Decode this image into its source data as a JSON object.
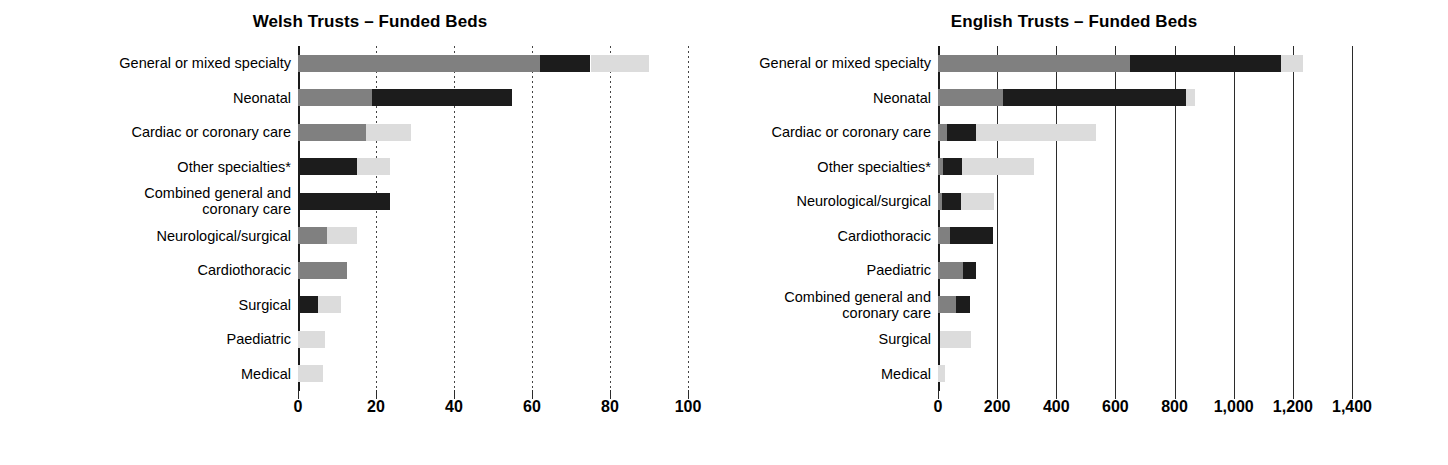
{
  "chart_data": [
    {
      "type": "bar",
      "orientation": "horizontal",
      "stacked": true,
      "title": "Welsh Trusts – Funded Beds",
      "xlabel": "",
      "ylabel": "",
      "xlim": [
        0,
        100
      ],
      "xticks": [
        0,
        20,
        40,
        60,
        80,
        100
      ],
      "xtick_labels": [
        "0",
        "20",
        "40",
        "60",
        "80",
        "100"
      ],
      "grid": "dotted-vertical",
      "legend": "none",
      "series": [
        {
          "name": "mid-grey",
          "color": "#808080"
        },
        {
          "name": "black",
          "color": "#1c1c1c"
        },
        {
          "name": "light-grey",
          "color": "#dcdcdc"
        }
      ],
      "categories": [
        "General or mixed specialty",
        "Neonatal",
        "Cardiac or coronary care",
        "Other specialties*",
        "Combined general and\ncoronary care",
        "Neurological/surgical",
        "Cardiothoracic",
        "Surgical",
        "Paediatric",
        "Medical"
      ],
      "values": [
        {
          "category": "General or mixed specialty",
          "segments": [
            62,
            13,
            15
          ],
          "total": 90
        },
        {
          "category": "Neonatal",
          "segments": [
            19,
            36,
            0
          ],
          "total": 55
        },
        {
          "category": "Cardiac or coronary care",
          "segments": [
            17.5,
            0,
            11.5
          ],
          "total": 29
        },
        {
          "category": "Other specialties*",
          "segments": [
            0,
            15,
            8.5
          ],
          "total": 23.5
        },
        {
          "category": "Combined general and coronary care",
          "segments": [
            0,
            23.5,
            0
          ],
          "total": 23.5
        },
        {
          "category": "Neurological/surgical",
          "segments": [
            7.5,
            0,
            7.5
          ],
          "total": 15
        },
        {
          "category": "Cardiothoracic",
          "segments": [
            12.5,
            0,
            0
          ],
          "total": 12.5
        },
        {
          "category": "Surgical",
          "segments": [
            0,
            5,
            6
          ],
          "total": 11
        },
        {
          "category": "Paediatric",
          "segments": [
            0,
            0,
            7
          ],
          "total": 7
        },
        {
          "category": "Medical",
          "segments": [
            0,
            0,
            6.5
          ],
          "total": 6.5
        }
      ]
    },
    {
      "type": "bar",
      "orientation": "horizontal",
      "stacked": true,
      "title": "English Trusts – Funded Beds",
      "xlabel": "",
      "ylabel": "",
      "xlim": [
        0,
        1400
      ],
      "xticks": [
        0,
        200,
        400,
        600,
        800,
        1000,
        1200,
        1400
      ],
      "xtick_labels": [
        "0",
        "200",
        "400",
        "600",
        "800",
        "1,000",
        "1,200",
        "1,400"
      ],
      "grid": "solid-vertical",
      "legend": "none",
      "series": [
        {
          "name": "mid-grey",
          "color": "#808080"
        },
        {
          "name": "black",
          "color": "#1c1c1c"
        },
        {
          "name": "light-grey",
          "color": "#dcdcdc"
        }
      ],
      "categories": [
        "General or mixed specialty",
        "Neonatal",
        "Cardiac or coronary care",
        "Other specialties*",
        "Neurological/surgical",
        "Cardiothoracic",
        "Paediatric",
        "Combined general and\ncoronary care",
        "Surgical",
        "Medical"
      ],
      "values": [
        {
          "category": "General or mixed specialty",
          "segments": [
            650,
            510,
            75
          ],
          "total": 1235
        },
        {
          "category": "Neonatal",
          "segments": [
            220,
            620,
            30
          ],
          "total": 870
        },
        {
          "category": "Cardiac or coronary care",
          "segments": [
            30,
            100,
            405
          ],
          "total": 535
        },
        {
          "category": "Other specialties*",
          "segments": [
            18,
            62,
            245
          ],
          "total": 325
        },
        {
          "category": "Neurological/surgical",
          "segments": [
            15,
            62,
            113
          ],
          "total": 190
        },
        {
          "category": "Cardiothoracic",
          "segments": [
            42,
            143,
            0
          ],
          "total": 185
        },
        {
          "category": "Paediatric",
          "segments": [
            85,
            45,
            0
          ],
          "total": 130
        },
        {
          "category": "Combined general and coronary care",
          "segments": [
            60,
            48,
            0
          ],
          "total": 108
        },
        {
          "category": "Surgical",
          "segments": [
            0,
            8,
            102
          ],
          "total": 110
        },
        {
          "category": "Medical",
          "segments": [
            0,
            0,
            25
          ],
          "total": 25
        }
      ]
    }
  ],
  "welsh": {
    "title": "Welsh Trusts – Funded Beds",
    "categories": [
      {
        "label": "General or mixed specialty"
      },
      {
        "label": "Neonatal"
      },
      {
        "label": "Cardiac or coronary care"
      },
      {
        "label": "Other specialties*"
      },
      {
        "label": "Combined general and\ncoronary care"
      },
      {
        "label": "Neurological/surgical"
      },
      {
        "label": "Cardiothoracic"
      },
      {
        "label": "Surgical"
      },
      {
        "label": "Paediatric"
      },
      {
        "label": "Medical"
      }
    ],
    "ticks": [
      {
        "label": "0"
      },
      {
        "label": "20"
      },
      {
        "label": "40"
      },
      {
        "label": "60"
      },
      {
        "label": "80"
      },
      {
        "label": "100"
      }
    ]
  },
  "english": {
    "title": "English Trusts – Funded Beds",
    "categories": [
      {
        "label": "General or mixed specialty"
      },
      {
        "label": "Neonatal"
      },
      {
        "label": "Cardiac or coronary care"
      },
      {
        "label": "Other specialties*"
      },
      {
        "label": "Neurological/surgical"
      },
      {
        "label": "Cardiothoracic"
      },
      {
        "label": "Paediatric"
      },
      {
        "label": "Combined general and\ncoronary care"
      },
      {
        "label": "Surgical"
      },
      {
        "label": "Medical"
      }
    ],
    "ticks": [
      {
        "label": "0"
      },
      {
        "label": "200"
      },
      {
        "label": "400"
      },
      {
        "label": "600"
      },
      {
        "label": "800"
      },
      {
        "label": "1,000"
      },
      {
        "label": "1,200"
      },
      {
        "label": "1,400"
      }
    ]
  },
  "colors": {
    "mid_grey": "#808080",
    "black": "#1c1c1c",
    "light_grey": "#dcdcdc",
    "background": "#ffffff"
  }
}
